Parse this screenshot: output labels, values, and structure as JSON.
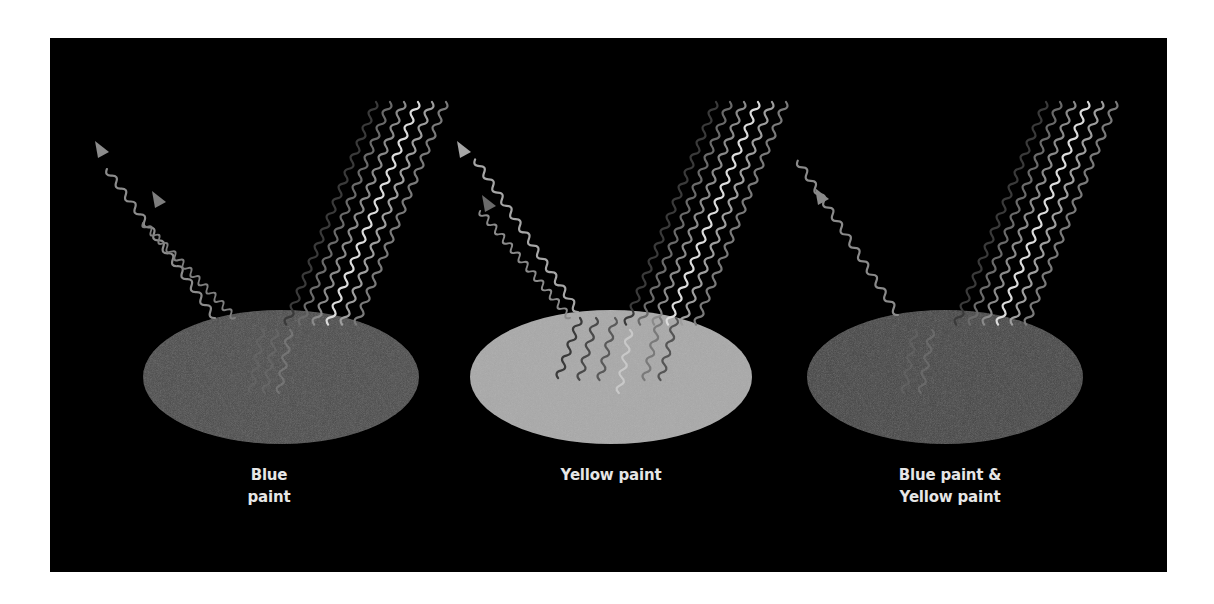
{
  "figure": {
    "background_color": "#000000",
    "page_color": "#ffffff",
    "panels": [
      {
        "id": "blue",
        "caption_line1": "Blue",
        "caption_line2": "paint",
        "ellipse_fill": "#4a4a4a",
        "reflected_arrows": 2
      },
      {
        "id": "yellow",
        "caption_line1": "Yellow paint",
        "caption_line2": "",
        "ellipse_fill": "#a9a9a9",
        "reflected_arrows": 2
      },
      {
        "id": "mixed",
        "caption_line1": "Blue paint &",
        "caption_line2": "Yellow paint",
        "ellipse_fill": "#434343",
        "reflected_arrows": 1
      }
    ],
    "incident_wave_shades": [
      "#3a3a3a",
      "#6a6a6a",
      "#8a8a8a",
      "#d8d8d8",
      "#9a9a9a",
      "#7a7a7a"
    ],
    "reflected_wave_color": "#8c8c8c"
  }
}
